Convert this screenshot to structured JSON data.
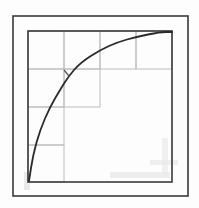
{
  "diagram": {
    "type": "hand-drawn sketch",
    "colors": {
      "background": "#fdfdfd",
      "frame": "#3a3a3a",
      "grid": "#bdbdbd",
      "curve": "#2a2a2a",
      "smudge": "#e4e4e4"
    },
    "outer_frame": {
      "x": 13,
      "y": 16,
      "width": 175,
      "height": 180
    },
    "inner_frame": {
      "x": 28,
      "y": 31,
      "width": 144,
      "height": 151
    },
    "grid": {
      "columns_x": [
        28,
        64,
        100,
        136,
        172
      ],
      "rows_y": [
        31,
        69,
        107,
        145,
        182
      ],
      "cells_per_row": [
        4,
        2,
        1,
        1
      ]
    },
    "curve": {
      "start": [
        29,
        181
      ],
      "end": [
        172,
        32
      ],
      "points": [
        [
          29,
          181
        ],
        [
          33,
          155
        ],
        [
          40,
          130
        ],
        [
          50,
          107
        ],
        [
          60,
          90
        ],
        [
          68,
          77
        ],
        [
          80,
          63
        ],
        [
          100,
          50
        ],
        [
          118,
          42
        ],
        [
          136,
          37
        ],
        [
          160,
          32
        ],
        [
          172,
          32
        ]
      ]
    },
    "tick_mark": {
      "from": [
        64,
        70
      ],
      "to": [
        69,
        76
      ]
    }
  }
}
